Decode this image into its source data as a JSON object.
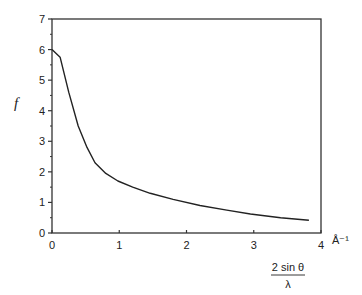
{
  "chart_data": {
    "type": "line",
    "title": "",
    "xlabel": "2 sin θ / λ",
    "xlabel_numerator": "2 sin θ",
    "xlabel_denominator": "λ",
    "x_unit": "Å⁻¹",
    "ylabel": "f",
    "xlim": [
      0,
      4
    ],
    "ylim": [
      0,
      7
    ],
    "x_ticks": [
      "0",
      "1",
      "2",
      "3",
      "4"
    ],
    "y_ticks": [
      "0",
      "1",
      "2",
      "3",
      "4",
      "5",
      "6",
      "7"
    ],
    "grid": false,
    "legend": null,
    "series": [
      {
        "name": "f",
        "x": [
          0,
          0.12,
          0.25,
          0.39,
          0.52,
          0.64,
          0.8,
          0.98,
          1.2,
          1.46,
          1.8,
          2.2,
          2.6,
          2.95,
          3.4,
          3.82
        ],
        "y": [
          6.0,
          5.75,
          4.6,
          3.5,
          2.8,
          2.3,
          1.95,
          1.7,
          1.5,
          1.3,
          1.1,
          0.9,
          0.75,
          0.62,
          0.5,
          0.42
        ]
      }
    ]
  }
}
